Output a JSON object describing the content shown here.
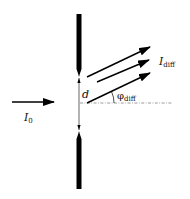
{
  "diagram": {
    "type": "single-slit diffraction schematic",
    "labels": {
      "incident_intensity": "I",
      "incident_subscript": "0",
      "diffracted_intensity": "I",
      "diffracted_subscript": "diff",
      "slit_width": "d",
      "diffraction_angle": "φ",
      "diffraction_angle_subscript": "diff"
    },
    "elements": {
      "barrier": "opaque screen with slit",
      "incident_arrow": "incident beam",
      "diffracted_arrows_count": 3,
      "reference_line": "dash-dot optical axis"
    },
    "colors": {
      "ink": "#000000",
      "background": "#ffffff"
    }
  }
}
